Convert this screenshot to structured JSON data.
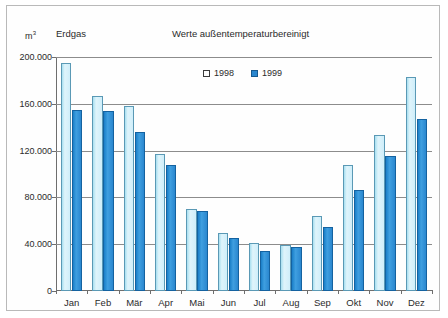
{
  "header": {
    "unit": "m",
    "unit_exponent": "3",
    "series_label": "Erdgas",
    "title": "Werte außentemperaturbereinigt"
  },
  "legend": {
    "items": [
      {
        "label": "1998",
        "color": "#dff4fb"
      },
      {
        "label": "1999",
        "color": "#2a87cf"
      }
    ]
  },
  "axis": {
    "y_ticks": [
      "0",
      "40.000",
      "80.000",
      "120.000",
      "160.000",
      "200.000"
    ]
  },
  "chart_data": {
    "type": "bar",
    "title": "Werte außentemperaturbereinigt",
    "xlabel": "",
    "ylabel": "m³",
    "ylim": [
      0,
      200000
    ],
    "ytick_values": [
      0,
      40000,
      80000,
      120000,
      160000,
      200000
    ],
    "grid": true,
    "legend_position": "top-right",
    "categories": [
      "Jan",
      "Feb",
      "Mär",
      "Apr",
      "Mai",
      "Jun",
      "Jul",
      "Aug",
      "Sep",
      "Okt",
      "Nov",
      "Dez"
    ],
    "series": [
      {
        "name": "1998",
        "color": "#dff4fb",
        "values": [
          195000,
          167000,
          158000,
          117000,
          70000,
          50000,
          41000,
          39000,
          64000,
          108000,
          133000,
          183000
        ]
      },
      {
        "name": "1999",
        "color": "#2a87cf",
        "values": [
          155000,
          154000,
          136000,
          108000,
          68000,
          45000,
          34000,
          38000,
          55000,
          86000,
          115000,
          147000
        ]
      }
    ]
  }
}
